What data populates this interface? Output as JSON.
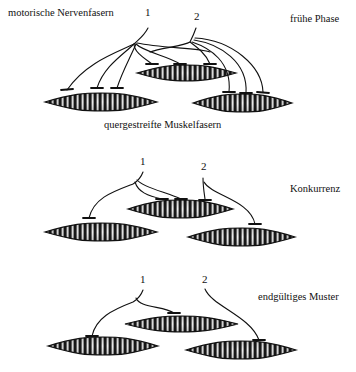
{
  "panels": [
    {
      "phase_label": "frühe Phase",
      "header_label": "motorische Nervenfasern",
      "footer_label": "quergestreifte Muskelfasern",
      "neuron_labels": [
        "1",
        "2"
      ],
      "fibers": [
        {
          "id": "A",
          "x1": 45,
          "x2": 157,
          "cy": 102,
          "h": 9
        },
        {
          "id": "B",
          "x1": 137,
          "x2": 236,
          "cy": 73,
          "h": 8
        },
        {
          "id": "C",
          "x1": 193,
          "x2": 292,
          "cy": 103,
          "h": 9
        }
      ],
      "synapse_count": {
        "neuron_1": 5,
        "neuron_2": 4
      }
    },
    {
      "phase_label": "Konkurrenz",
      "neuron_labels": [
        "1",
        "2"
      ],
      "fibers": [
        {
          "id": "A",
          "x1": 45,
          "x2": 157,
          "cy": 232,
          "h": 9
        },
        {
          "id": "B",
          "x1": 128,
          "x2": 233,
          "cy": 209,
          "h": 9
        },
        {
          "id": "C",
          "x1": 188,
          "x2": 295,
          "cy": 237,
          "h": 9
        }
      ],
      "synapse_count": {
        "neuron_1": 3,
        "neuron_2": 2
      }
    },
    {
      "phase_label": "endgültiges Muster",
      "neuron_labels": [
        "1",
        "2"
      ],
      "fibers": [
        {
          "id": "A",
          "x1": 48,
          "x2": 158,
          "cy": 346,
          "h": 9
        },
        {
          "id": "B",
          "x1": 125,
          "x2": 238,
          "cy": 324,
          "h": 8
        },
        {
          "id": "C",
          "x1": 186,
          "x2": 296,
          "cy": 350,
          "h": 9
        }
      ],
      "synapse_count": {
        "neuron_1": 2,
        "neuron_2": 1
      }
    }
  ],
  "colors": {
    "ink": "#111111",
    "background": "#ffffff"
  }
}
